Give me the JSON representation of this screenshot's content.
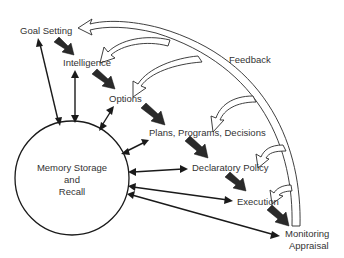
{
  "diagram": {
    "title_cropped": "",
    "center_node": {
      "lines": [
        "Memory Storage",
        "and",
        "Recall"
      ]
    },
    "stages": [
      {
        "id": "goal",
        "label": "Goal Setting"
      },
      {
        "id": "intel",
        "label": "Intelligence"
      },
      {
        "id": "options",
        "label": "Options"
      },
      {
        "id": "plans",
        "label": "Plans, Programs, Decisions"
      },
      {
        "id": "policy",
        "label": "Declaratory Policy"
      },
      {
        "id": "exec",
        "label": "Execution"
      },
      {
        "id": "monitor",
        "label_lines": [
          "Monitoring",
          "Appraisal"
        ]
      }
    ],
    "feedback_label": "Feedback",
    "colors": {
      "line": "#1a1a1a",
      "text": "#333333",
      "background": "#ffffff"
    }
  }
}
